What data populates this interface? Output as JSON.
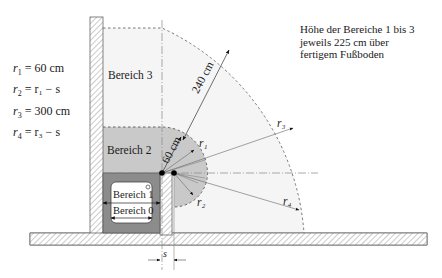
{
  "note": {
    "lines": [
      "Höhe der Bereiche 1 bis 3",
      "jeweils 225 cm über",
      "fertigem Fußboden"
    ]
  },
  "formulas": [
    {
      "lhs": "r",
      "sub": "1",
      "rhs": "= 60 cm"
    },
    {
      "lhs": "r",
      "sub": "2",
      "rhs": "= r₁ − s"
    },
    {
      "lhs": "r",
      "sub": "3",
      "rhs": "= 300 cm"
    },
    {
      "lhs": "r",
      "sub": "4",
      "rhs": "= r₃ − s"
    }
  ],
  "zones": {
    "zone3": "Bereich 3",
    "zone2": "Bereich 2",
    "zone1": "Bereich 1",
    "zone0": "Bereich 0"
  },
  "dimensions": {
    "d240": "240 cm",
    "d60": "60 cm",
    "s": "s"
  },
  "radii_labels": {
    "r1": "r₁",
    "r2": "r₂",
    "r3": "r₃",
    "r4": "r₄"
  },
  "colors": {
    "zone3_fill": "#f4f4f4",
    "zone2_fill": "#c8c8c8",
    "bath_fill": "#8a8a8a",
    "hatch": "#9a9a9a",
    "line": "#555555"
  }
}
